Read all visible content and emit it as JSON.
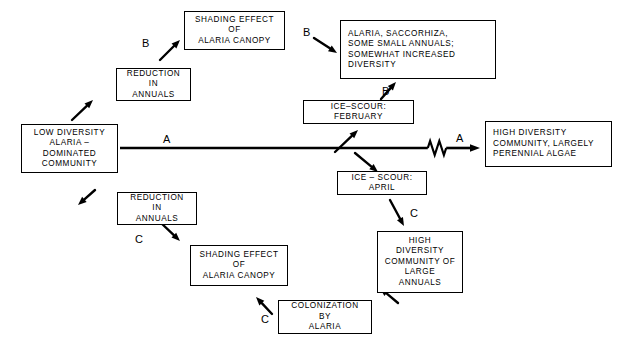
{
  "diagram": {
    "colors": {
      "stroke": "#000000",
      "background": "#ffffff",
      "text": "#000000"
    },
    "boxes": [
      {
        "id": "low-diversity-community",
        "text": "LOW DIVERSITY\nALARIA –\nDOMINATED\nCOMMUNITY",
        "align": "center",
        "x": 21,
        "y": 124,
        "w": 97,
        "h": 49
      },
      {
        "id": "reduction-in-annuals-upper",
        "text": "REDUCTION\nIN\nANNUALS",
        "align": "center",
        "x": 116,
        "y": 68,
        "w": 75,
        "h": 33
      },
      {
        "id": "shading-effect-upper",
        "text": "SHADING EFFECT\nOF\nALARIA CANOPY",
        "align": "center",
        "x": 184,
        "y": 11,
        "w": 101,
        "h": 39
      },
      {
        "id": "alaria-saccorhiza-diversity",
        "text": "ALARIA, SACCORHIZA,\nSOME SMALL ANNUALS;\nSOMEWHAT INCREASED\nDIVERSITY",
        "align": "left",
        "x": 340,
        "y": 20,
        "w": 156,
        "h": 59
      },
      {
        "id": "ice-scour-february",
        "text": "ICE–SCOUR:\nFEBRUARY",
        "align": "center",
        "x": 303,
        "y": 100,
        "w": 111,
        "h": 24
      },
      {
        "id": "high-diversity-perennial",
        "text": "HIGH DIVERSITY\nCOMMUNITY, LARGELY\nPERENNIAL ALGAE",
        "align": "left",
        "x": 485,
        "y": 121,
        "w": 127,
        "h": 46
      },
      {
        "id": "ice-scour-april",
        "text": "ICE – SCOUR:\nAPRIL",
        "align": "center",
        "x": 337,
        "y": 171,
        "w": 90,
        "h": 24
      },
      {
        "id": "high-diversity-large-annuals",
        "text": "HIGH\nDIVERSITY\nCOMMUNITY OF\nLARGE\nANNUALS",
        "align": "center",
        "x": 377,
        "y": 231,
        "w": 86,
        "h": 62
      },
      {
        "id": "reduction-in-annuals-lower",
        "text": "REDUCTION\nIN\nANNUALS",
        "align": "center",
        "x": 117,
        "y": 192,
        "w": 80,
        "h": 33
      },
      {
        "id": "shading-effect-lower",
        "text": "SHADING EFFECT\nOF\nALARIA CANOPY",
        "align": "center",
        "x": 190,
        "y": 245,
        "w": 98,
        "h": 41
      },
      {
        "id": "colonization-by-alaria",
        "text": "COLONIZATION\nBY\nALARIA",
        "align": "center",
        "x": 278,
        "y": 300,
        "w": 94,
        "h": 34
      }
    ],
    "path_labels": [
      {
        "id": "label-b-left",
        "text": "B",
        "x": 142,
        "y": 37
      },
      {
        "id": "label-b-top",
        "text": "B",
        "x": 303,
        "y": 26
      },
      {
        "id": "label-b-bottom",
        "text": "B",
        "x": 382,
        "y": 85
      },
      {
        "id": "label-a-left",
        "text": "A",
        "x": 163,
        "y": 133
      },
      {
        "id": "label-a-right",
        "text": "A",
        "x": 456,
        "y": 132
      },
      {
        "id": "label-c-right",
        "text": "C",
        "x": 410,
        "y": 207
      },
      {
        "id": "label-c-left",
        "text": "C",
        "x": 135,
        "y": 233
      },
      {
        "id": "label-c-bottom",
        "text": "C",
        "x": 261,
        "y": 313
      }
    ],
    "arrows": [
      {
        "id": "arrow-low-to-reduction",
        "x1": 72,
        "y1": 120,
        "x2": 93,
        "y2": 100
      },
      {
        "id": "arrow-reduction-to-shading",
        "x1": 160,
        "y1": 60,
        "x2": 180,
        "y2": 40
      },
      {
        "id": "arrow-shading-to-alaria",
        "x1": 314,
        "y1": 38,
        "x2": 337,
        "y2": 53
      },
      {
        "id": "arrow-icescour-feb-to-alaria",
        "x1": 381,
        "y1": 99,
        "x2": 396,
        "y2": 82
      },
      {
        "id": "arrow-main-to-icescour-feb",
        "x1": 335,
        "y1": 152,
        "x2": 358,
        "y2": 130
      },
      {
        "id": "arrow-main-to-icescour-april",
        "x1": 355,
        "y1": 153,
        "x2": 378,
        "y2": 172
      },
      {
        "id": "arrow-april-to-large-annuals",
        "x1": 390,
        "y1": 200,
        "x2": 404,
        "y2": 226
      },
      {
        "id": "arrow-annuals-to-colonization",
        "x1": 398,
        "y1": 303,
        "x2": 380,
        "y2": 288
      },
      {
        "id": "arrow-colonization-to-shading",
        "x1": 272,
        "y1": 314,
        "x2": 256,
        "y2": 297
      },
      {
        "id": "arrow-shading-to-reduction",
        "x1": 160,
        "y1": 222,
        "x2": 180,
        "y2": 241
      },
      {
        "id": "arrow-reduction-to-low",
        "x1": 95,
        "y1": 190,
        "x2": 78,
        "y2": 205
      }
    ],
    "main_axis": {
      "id": "main-pathway-a",
      "x_start": 120,
      "x_end": 480,
      "y": 148,
      "break_symbol": "zigzag",
      "break_x": 437
    }
  }
}
